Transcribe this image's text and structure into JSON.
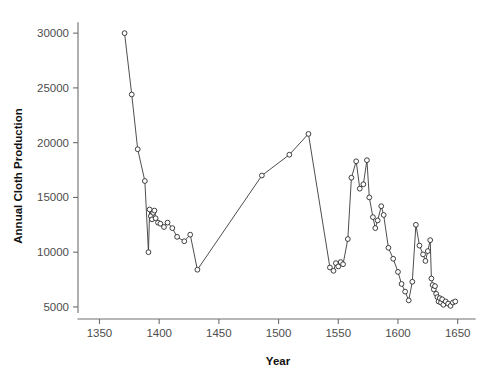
{
  "chart_data": {
    "type": "line",
    "title": "",
    "subtitle": "",
    "xlabel": "Year",
    "ylabel": "Annual Cloth Production",
    "xlim": [
      1332,
      1662
    ],
    "ylim": [
      3900,
      31200
    ],
    "xticks": [
      1350,
      1400,
      1450,
      1500,
      1550,
      1600,
      1650
    ],
    "xticklabels": [
      "1350",
      "1400",
      "1450",
      "1500",
      "1550",
      "1600",
      "1650"
    ],
    "yticks": [
      5000,
      10000,
      15000,
      20000,
      25000,
      30000
    ],
    "yticklabels": [
      "5000",
      "10000",
      "15000",
      "20000",
      "25000",
      "30000"
    ],
    "grid": false,
    "legend": null,
    "marker": "open-circle",
    "line_color": "#3a3a3a",
    "marker_face_color": "#ffffff",
    "marker_edge_color": "#2b2b2b",
    "series": [
      {
        "name": "Annual Cloth Production",
        "x": [
          1371,
          1377,
          1382,
          1388,
          1391,
          1392,
          1393,
          1394,
          1395,
          1396,
          1397,
          1399,
          1401,
          1404,
          1407,
          1411,
          1415,
          1421,
          1426,
          1432,
          1486,
          1509,
          1525,
          1543,
          1546,
          1548,
          1550,
          1552,
          1554,
          1558,
          1561,
          1565,
          1568,
          1571,
          1574,
          1576,
          1579,
          1581,
          1583,
          1586,
          1588,
          1592,
          1596,
          1600,
          1603,
          1606,
          1609,
          1612,
          1615,
          1618,
          1621,
          1623,
          1625,
          1627,
          1628,
          1629,
          1630,
          1631,
          1632,
          1633,
          1634,
          1635,
          1636,
          1637,
          1638,
          1640,
          1642,
          1644,
          1646,
          1648
        ],
        "y": [
          30000,
          24400,
          19400,
          16500,
          10000,
          13900,
          13300,
          13000,
          13600,
          13800,
          13100,
          12700,
          12600,
          12300,
          12700,
          12200,
          11400,
          11000,
          11600,
          8400,
          17000,
          18900,
          20800,
          8600,
          8300,
          9000,
          8700,
          9100,
          8900,
          11200,
          16800,
          18300,
          15800,
          16200,
          18400,
          15000,
          13200,
          12200,
          12900,
          14200,
          13400,
          10400,
          9400,
          8200,
          7100,
          6400,
          5600,
          7300,
          12500,
          10600,
          9800,
          9200,
          10100,
          11100,
          7600,
          7000,
          6600,
          6900,
          6200,
          5900,
          5500,
          5800,
          5400,
          5700,
          5200,
          5500,
          5300,
          5100,
          5400,
          5500
        ]
      }
    ]
  }
}
